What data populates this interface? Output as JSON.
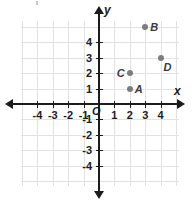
{
  "chart_data": {
    "type": "scatter",
    "title": "",
    "xlabel": "x",
    "ylabel": "y",
    "xlim": [
      -5.2,
      5.3
    ],
    "ylim": [
      -5.5,
      5.5
    ],
    "grid": true,
    "legend": "none",
    "origin_label": "O",
    "xticks": [
      -4,
      -3,
      -2,
      -1,
      1,
      2,
      3,
      4
    ],
    "yticks": [
      4,
      3,
      2,
      1,
      -1,
      -2,
      -3,
      -4
    ],
    "xtick_labels": [
      "-4",
      "-3",
      "-2",
      "-1",
      "1",
      "2",
      "3",
      "4"
    ],
    "ytick_labels": [
      "4",
      "3",
      "2",
      "1",
      "-1",
      "-2",
      "-3",
      "-4"
    ],
    "point_color": "#7d7d7d",
    "axis_color": "#1c1c1c",
    "grid_color": "#e2e2e4",
    "points": [
      {
        "label": "A",
        "x": 2,
        "y": 1,
        "label_side": "right"
      },
      {
        "label": "B",
        "x": 3,
        "y": 5,
        "label_side": "right"
      },
      {
        "label": "C",
        "x": 2,
        "y": 2,
        "label_side": "left"
      },
      {
        "label": "D",
        "x": 4,
        "y": 3,
        "label_side": "below-right"
      }
    ]
  }
}
